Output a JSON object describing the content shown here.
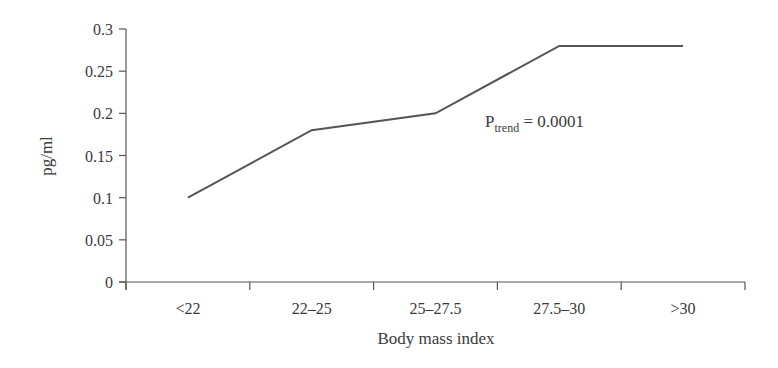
{
  "chart_data": {
    "type": "line",
    "title": "",
    "xlabel": "Body mass index",
    "ylabel": "pg/ml",
    "categories": [
      "<22",
      "22–25",
      "25–27.5",
      "27.5–30",
      ">30"
    ],
    "series": [
      {
        "name": "pg/ml",
        "values": [
          0.1,
          0.18,
          0.2,
          0.28,
          0.28
        ]
      }
    ],
    "ylim": [
      0,
      0.3
    ],
    "yticks": [
      "0",
      "0.05",
      "0.1",
      "0.15",
      "0.2",
      "0.25",
      "0.3"
    ],
    "ytick_values": [
      0,
      0.05,
      0.1,
      0.15,
      0.2,
      0.25,
      0.3
    ],
    "grid": false,
    "legend": null,
    "annotations": [
      {
        "text": "P",
        "subscript": "trend",
        "suffix": " = 0.0001",
        "full": "P_trend = 0.0001"
      }
    ],
    "line_color": "#555555"
  }
}
